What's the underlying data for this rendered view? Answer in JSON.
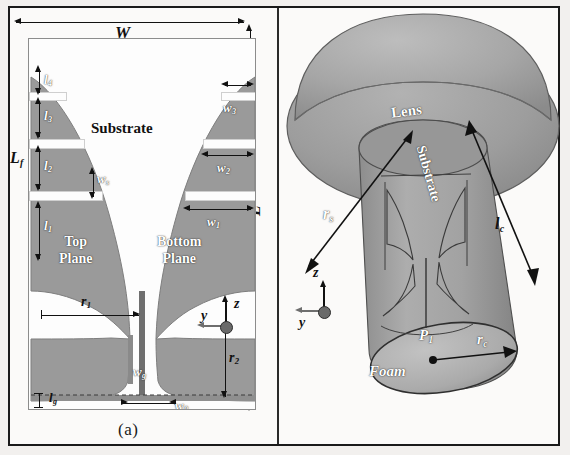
{
  "figure": {
    "panels": [
      {
        "id": "a",
        "caption": "(a)",
        "title": "Antipodal Vivaldi antenna layout"
      },
      {
        "id": "b",
        "caption": "(b)",
        "title": "Lens-loaded antenna 3D assembly"
      }
    ]
  },
  "panel_a": {
    "caption": "(a)",
    "regions": {
      "substrate": "Substrate",
      "top_plane": "Top\nPlane",
      "top_plane_l1": "Top",
      "top_plane_l2": "Plane",
      "bottom_plane_l1": "Bottom",
      "bottom_plane_l2": "Plane"
    },
    "dimensions": {
      "W": "W",
      "L": "L",
      "Hf": "H",
      "Hf_sub": "f",
      "Lf": "L",
      "Lf_sub": "f",
      "l1": "l",
      "l1_sub": "1",
      "l2": "l",
      "l2_sub": "2",
      "l3": "l",
      "l3_sub": "3",
      "l4": "l",
      "l4_sub": "4",
      "lg": "l",
      "lg_sub": "g",
      "w1": "w",
      "w1_sub": "1",
      "w2": "w",
      "w2_sub": "2",
      "w3": "w",
      "w3_sub": "3",
      "ws": "w",
      "ws_sub": "s",
      "wg": "w",
      "wg_sub": "g",
      "w0": "w",
      "w0_sub": "0",
      "r1": "r",
      "r1_sub": "1",
      "r2": "r",
      "r2_sub": "2"
    },
    "axes": {
      "z": "z",
      "y": "y"
    }
  },
  "panel_b": {
    "caption": "(b)",
    "regions": {
      "lens": "Lens",
      "substrate": "Substrate",
      "foam": "Foam"
    },
    "dimensions": {
      "rs": "r",
      "rs_sub": "s",
      "rc": "r",
      "rc_sub": "c",
      "lc": "l",
      "lc_sub": "c",
      "P1": "P",
      "P1_sub": "1"
    },
    "axes": {
      "z": "z",
      "y": "y"
    }
  },
  "colors": {
    "metal_fill": "#9a9a9a",
    "metal_fill_dark": "#8a8a8a",
    "substrate_fill": "#fdfdfd",
    "lens_light": "#a8a8a8",
    "lens_mid": "#9b9b9b",
    "lens_dark": "#8d8d8d",
    "foam_fill": "#b0b0b0",
    "line": "#111111",
    "page_bg": "#f2f0ee",
    "frame": "#1a1a1a"
  }
}
